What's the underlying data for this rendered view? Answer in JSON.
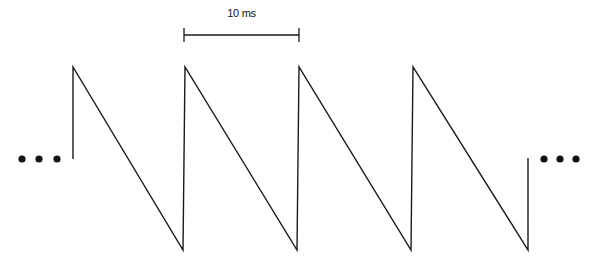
{
  "diagram": {
    "type": "sawtooth-waveform",
    "scale_bar": {
      "label": "10 ms",
      "x1": 184,
      "x2": 299,
      "y": 35
    },
    "ellipsis_left": "...",
    "ellipsis_right": "...",
    "waveform": {
      "top_y": 67,
      "bottom_y": 250,
      "mid_y": 158,
      "peaks_x": [
        73,
        185,
        299,
        413
      ],
      "troughs_x": [
        183,
        297,
        411,
        528
      ]
    },
    "line_color": "#1a1a1a"
  }
}
